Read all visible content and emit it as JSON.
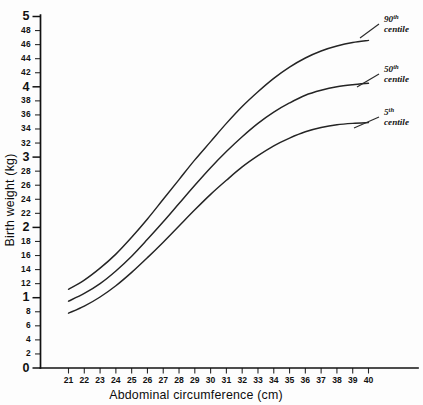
{
  "chart_data": {
    "type": "line",
    "title": "",
    "xlabel": "Abdominal circumference (cm)",
    "ylabel": "Birth weight (kg)",
    "xlim": [
      20.4,
      40.6
    ],
    "ylim": [
      0,
      5
    ],
    "grid": false,
    "legend_position": "inline-right-of-curve-ends",
    "x_ticks": [
      21,
      22,
      23,
      24,
      25,
      26,
      27,
      28,
      29,
      30,
      31,
      32,
      33,
      34,
      35,
      36,
      37,
      38,
      39,
      40
    ],
    "x_tick_labels": [
      "21",
      "22",
      "23",
      "24",
      "25",
      "26",
      "27",
      "28",
      "29",
      "30",
      "31",
      "32",
      "33",
      "34",
      "35",
      "36",
      "37",
      "38",
      "39",
      "40"
    ],
    "y_ticks": [
      0,
      0.2,
      0.4,
      0.6,
      0.8,
      1.0,
      1.2,
      1.4,
      1.6,
      1.8,
      2.0,
      2.2,
      2.4,
      2.6,
      2.8,
      3.0,
      3.2,
      3.4,
      3.6,
      3.8,
      4.0,
      4.2,
      4.4,
      4.6,
      4.8,
      5.0
    ],
    "y_tick_labels": [
      "0",
      "2",
      "4",
      "6",
      "8",
      "1",
      "12",
      "14",
      "16",
      "18",
      "2",
      "22",
      "24",
      "26",
      "28",
      "3",
      "32",
      "34",
      "36",
      "38",
      "4",
      "42",
      "44",
      "46",
      "48",
      "5"
    ],
    "y_tick_major": [
      0,
      1.0,
      2.0,
      3.0,
      4.0,
      5.0
    ],
    "x": [
      21,
      22,
      23,
      24,
      25,
      26,
      27,
      28,
      29,
      30,
      31,
      32,
      33,
      34,
      35,
      36,
      37,
      38,
      39,
      40
    ],
    "series": [
      {
        "name": "90th centile",
        "label_line1": "90",
        "label_sup": "th",
        "label_line2": "centile",
        "values": [
          1.12,
          1.25,
          1.42,
          1.62,
          1.86,
          2.12,
          2.4,
          2.68,
          2.96,
          3.22,
          3.48,
          3.72,
          3.93,
          4.12,
          4.28,
          4.41,
          4.51,
          4.58,
          4.63,
          4.66
        ]
      },
      {
        "name": "50th centile",
        "label_line1": "50",
        "label_sup": "th",
        "label_line2": "centile",
        "values": [
          0.95,
          1.06,
          1.2,
          1.38,
          1.59,
          1.83,
          2.08,
          2.34,
          2.6,
          2.85,
          3.08,
          3.29,
          3.48,
          3.64,
          3.77,
          3.88,
          3.95,
          4.0,
          4.03,
          4.05
        ]
      },
      {
        "name": "5th centile",
        "label_line1": "5",
        "label_sup": "th",
        "label_line2": "centile",
        "values": [
          0.78,
          0.88,
          1.01,
          1.17,
          1.36,
          1.57,
          1.79,
          2.02,
          2.25,
          2.47,
          2.67,
          2.86,
          3.02,
          3.16,
          3.27,
          3.36,
          3.42,
          3.46,
          3.48,
          3.49
        ]
      }
    ]
  },
  "labels": {
    "x_axis_title": "Abdominal circumference (cm)",
    "y_axis_title": "Birth weight (kg)"
  }
}
